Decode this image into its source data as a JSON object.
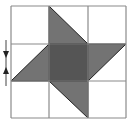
{
  "figure": {
    "grid": {
      "rows": 3,
      "cols": 3,
      "x_lines": [
        11,
        49,
        88,
        126
      ],
      "y_lines": [
        6,
        44,
        81,
        118
      ]
    },
    "colors": {
      "background": "#ffffff",
      "grid_line": "#8a8a8a",
      "shape_outline": "#222222",
      "center_square": "#555555",
      "triangles": "#737373",
      "markers": "#222222"
    },
    "shapes": {
      "center_square": {
        "x": 49,
        "y": 44,
        "w": 39,
        "h": 37
      },
      "triangles": [
        {
          "name": "top",
          "points": "49,6 49,44 88,44"
        },
        {
          "name": "right",
          "points": "88,44 126,44 88,81"
        },
        {
          "name": "bottom",
          "points": "49,81 88,81 88,118"
        },
        {
          "name": "left",
          "points": "11,81 49,44 49,81"
        }
      ]
    },
    "markers": {
      "line_x": 6,
      "line_y1": 40,
      "line_y2": 86,
      "arrow_down": "3,51 9,51 6,58",
      "arrow_up": "3,74 9,74 6,67"
    }
  }
}
